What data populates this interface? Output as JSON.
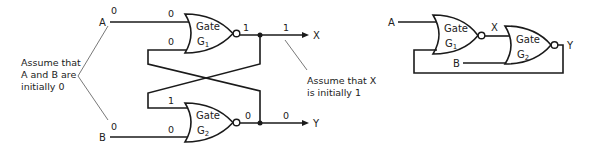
{
  "left_diagram": {
    "inputs": {
      "a_label": "A",
      "b_label": "B"
    },
    "outputs": {
      "x_label": "X",
      "y_label": "Y"
    },
    "gate1": {
      "word": "Gate",
      "name": "G",
      "sub": "1"
    },
    "gate2": {
      "word": "Gate",
      "name": "G",
      "sub": "2"
    },
    "values": {
      "a_in": "0",
      "g1_in_top": "0",
      "g1_in_bottom": "0",
      "g1_out": "1",
      "x_out": "1",
      "g2_in_top": "1",
      "b_in": "0",
      "g2_in_bottom": "0",
      "g2_out": "0",
      "y_out": "0"
    },
    "notes": {
      "ab_line1": "Assume that",
      "ab_line2": "A and B are",
      "ab_line3": "initially 0",
      "x_line1": "Assume that X",
      "x_line2": "is initially 1"
    }
  },
  "right_diagram": {
    "a_label": "A",
    "b_label": "B",
    "x_label": "X",
    "y_label": "Y",
    "gate1": {
      "word": "Gate",
      "name": "G",
      "sub": "1"
    },
    "gate2": {
      "word": "Gate",
      "name": "G",
      "sub": "2"
    }
  },
  "colors": {
    "line": "#1a1a1a",
    "text": "#222222",
    "background": "#ffffff"
  }
}
